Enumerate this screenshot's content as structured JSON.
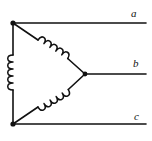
{
  "diagram": {
    "type": "delta-connected three-phase winding",
    "terminals": [
      {
        "label": "a"
      },
      {
        "label": "b"
      },
      {
        "label": "c"
      }
    ],
    "windings": [
      {
        "name": "coil-left-vertical"
      },
      {
        "name": "coil-upper-diagonal"
      },
      {
        "name": "coil-lower-diagonal"
      }
    ],
    "colors": {
      "line": "#111111",
      "background": "#ffffff"
    }
  }
}
